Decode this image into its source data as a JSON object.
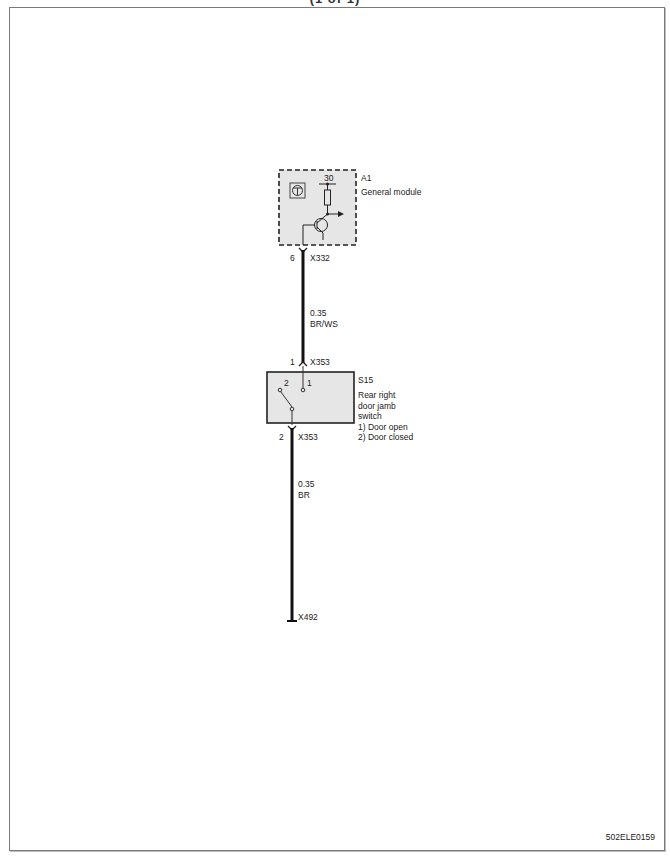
{
  "header": {
    "title_partial": "(1 of 1)"
  },
  "document_id": "502ELE0159",
  "components": [
    {
      "id": "A1",
      "name": "General module",
      "terminal_supply": "30",
      "pin": "6",
      "connector": "X332"
    },
    {
      "id": "S15",
      "name_lines": [
        "Rear right",
        "door jamb",
        "switch"
      ],
      "states": [
        "1) Door open",
        "2) Door closed"
      ],
      "contact_labels": [
        "2",
        "1"
      ],
      "pin_top": "1",
      "connector_top": "X353",
      "pin_bottom": "2",
      "connector_bottom": "X353"
    }
  ],
  "wires": [
    {
      "gauge": "0.35",
      "color": "BR/WS",
      "from": "A1 X332 pin 6",
      "to": "S15 X353 pin 1"
    },
    {
      "gauge": "0.35",
      "color": "BR",
      "from": "S15 X353 pin 2",
      "to": "X492"
    }
  ],
  "ground": {
    "id": "X492"
  },
  "colors": {
    "module_fill": "#e6e6e6",
    "wire": "#111111",
    "frame": "#7a7a7a"
  }
}
